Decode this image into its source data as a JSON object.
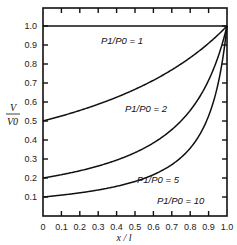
{
  "chart_data": {
    "type": "line",
    "title": "",
    "xlabel": "x / l",
    "ylabel": "V / V0",
    "xlim": [
      0,
      1.0
    ],
    "ylim": [
      0,
      1.0
    ],
    "grid": false,
    "legend_position": "inline labels on curves",
    "x_ticks": [
      "0",
      "0.1",
      "0.2",
      "0.3",
      "0.4",
      "0.5",
      "0.6",
      "0.7",
      "0.8",
      "0.9",
      "1.0"
    ],
    "y_ticks": [
      "0.1",
      "0.2",
      "0.3",
      "0.4",
      "0.5",
      "0.6",
      "0.7",
      "0.8",
      "0.9",
      "1.0"
    ],
    "x": [
      0,
      0.1,
      0.2,
      0.3,
      0.4,
      0.5,
      0.6,
      0.7,
      0.8,
      0.9,
      0.95,
      1.0
    ],
    "series": [
      {
        "name": "P1/P0 = 1",
        "values": [
          1.0,
          1.0,
          1.0,
          1.0,
          1.0,
          1.0,
          1.0,
          1.0,
          1.0,
          1.0,
          1.0,
          1.0
        ]
      },
      {
        "name": "P1/P0 = 2",
        "values": [
          0.5,
          0.526,
          0.556,
          0.588,
          0.625,
          0.667,
          0.714,
          0.769,
          0.833,
          0.909,
          0.952,
          1.0
        ]
      },
      {
        "name": "P1/P0 = 5",
        "values": [
          0.2,
          0.217,
          0.238,
          0.263,
          0.294,
          0.333,
          0.385,
          0.455,
          0.556,
          0.714,
          0.833,
          1.0
        ]
      },
      {
        "name": "P1/P0 = 10",
        "values": [
          0.1,
          0.11,
          0.122,
          0.137,
          0.156,
          0.182,
          0.217,
          0.27,
          0.357,
          0.526,
          0.69,
          1.0
        ]
      }
    ],
    "annotations": [
      "P1/P0 = 1",
      "P1/P0 = 2",
      "P1/P0 = 5",
      "P1/P0 = 10"
    ]
  },
  "labels": {
    "y_axis_num": "V",
    "y_axis_den": "V0",
    "x_axis": "x / l",
    "curve_1": "P1/P0 = 1",
    "curve_2": "P1/P0 = 2",
    "curve_5": "P1/P0 = 5",
    "curve_10": "P1/P0 = 10"
  }
}
